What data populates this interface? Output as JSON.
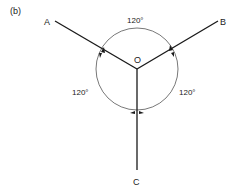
{
  "figure": {
    "panel_label": "(b)",
    "center_label": "O",
    "points": [
      {
        "id": "A",
        "label": "A"
      },
      {
        "id": "B",
        "label": "B"
      },
      {
        "id": "C",
        "label": "C"
      }
    ],
    "angles": [
      {
        "between": "A-B",
        "label": "120°"
      },
      {
        "between": "A-C",
        "label": "120°"
      },
      {
        "between": "B-C",
        "label": "120°"
      }
    ],
    "colors": {
      "line": "#1a1a1a",
      "circle": "#555555",
      "background": "#ffffff"
    }
  }
}
